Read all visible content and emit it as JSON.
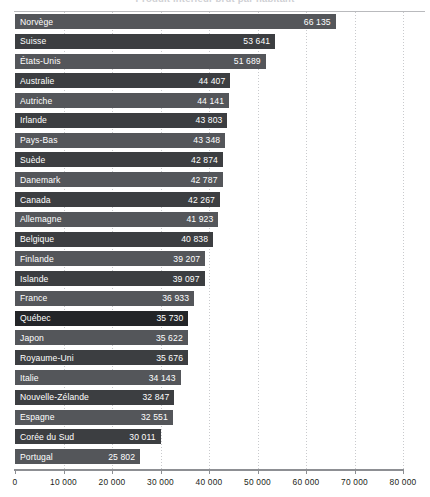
{
  "chart_data": {
    "type": "bar",
    "orientation": "horizontal",
    "title": "Produit intérieur brut par habitant",
    "xlabel": "",
    "ylabel": "",
    "xlim": [
      0,
      80000
    ],
    "xticks": [
      0,
      10000,
      20000,
      30000,
      40000,
      50000,
      60000,
      70000,
      80000
    ],
    "xticklabels": [
      "0",
      "10 000",
      "20 000",
      "30 000",
      "40 000",
      "50 000",
      "60 000",
      "70 000",
      "80 000"
    ],
    "grid": "vertical-dotted",
    "legend": "none",
    "categories": [
      "Norvège",
      "Suisse",
      "États-Unis",
      "Australie",
      "Autriche",
      "Irlande",
      "Pays-Bas",
      "Suède",
      "Danemark",
      "Canada",
      "Allemagne",
      "Belgique",
      "Finlande",
      "Islande",
      "France",
      "Québec",
      "Japon",
      "Royaume-Uni",
      "Italie",
      "Nouvelle-Zélande",
      "Espagne",
      "Corée du Sud",
      "Portugal"
    ],
    "values": [
      66135,
      53641,
      51689,
      44407,
      44141,
      43803,
      43348,
      42874,
      42787,
      42267,
      41923,
      40838,
      39207,
      39097,
      36933,
      35730,
      35622,
      35676,
      34143,
      32847,
      32551,
      30011,
      25802
    ],
    "value_labels": [
      "66 135",
      "53 641",
      "51 689",
      "44 407",
      "44 141",
      "43 803",
      "43 348",
      "42 874",
      "42 787",
      "42 267",
      "41 923",
      "40 838",
      "39 207",
      "39 097",
      "36 933",
      "35 730",
      "35 622",
      "35 676",
      "34 143",
      "32 847",
      "32 551",
      "30 011",
      "25 802"
    ],
    "highlight_category": "Québec",
    "colors": {
      "bar_light": "#54565a",
      "bar_dark": "#3c3e41",
      "bar_highlight": "#232528",
      "value_text": "#ffffff",
      "label_text": "#ffffff",
      "axis": "#8d8f93",
      "gridline": "#c9cacd",
      "background": "#ffffff"
    }
  }
}
